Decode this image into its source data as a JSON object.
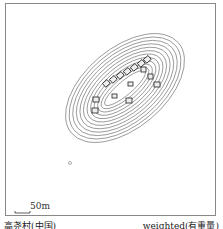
{
  "figure": {
    "scale_bar_label": "50m",
    "caption_left": "高尧村(中国)",
    "caption_right": "weighted(有重量)",
    "contour_color": "#555555",
    "frame_color": "#888888"
  }
}
